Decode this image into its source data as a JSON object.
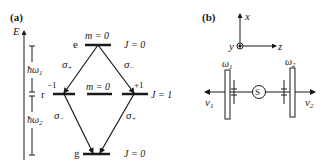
{
  "panel_a": {
    "label": "(a)",
    "axis_label": "E",
    "energy_gap_1": {
      "symbol": "ħω",
      "sub": "1"
    },
    "energy_gap_2": {
      "symbol": "ħω",
      "sub": "2"
    },
    "levels": {
      "e": {
        "name": "e",
        "m": "m = 0",
        "J": "J = 0"
      },
      "r": {
        "name": "r",
        "m_left": "−1",
        "m_mid": "m = 0",
        "m_right": "+1",
        "J": "J = 1"
      },
      "g": {
        "name": "g",
        "J": "J = 0"
      }
    },
    "transitions": {
      "e_to_r_left": {
        "sym": "σ",
        "sub": "+"
      },
      "e_to_r_right": {
        "sym": "σ",
        "sub": "−"
      },
      "r_left_to_g": {
        "sym": "σ",
        "sub": "−"
      },
      "r_right_to_g": {
        "sym": "σ",
        "sub": "+"
      }
    }
  },
  "panel_b": {
    "label": "(b)",
    "axes": {
      "x": "x",
      "y": "y",
      "z": "z"
    },
    "source": "S",
    "filter_1": {
      "sym": "ω",
      "sub": "1"
    },
    "filter_2": {
      "sym": "ω",
      "sub": "2"
    },
    "photon_1": {
      "sym": "ν",
      "sub": "1"
    },
    "photon_2": {
      "sym": "ν",
      "sub": "2"
    }
  },
  "colors": {
    "line": "#1a1a1a",
    "background": "#ffffff"
  }
}
